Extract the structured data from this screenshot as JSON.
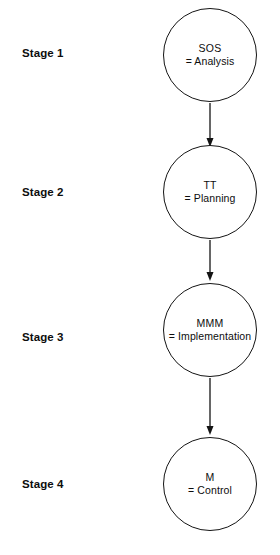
{
  "diagram": {
    "background_color": "#ffffff",
    "stroke_color": "#141414",
    "text_color": "#0d0d0d",
    "stages": [
      {
        "label": "Stage 1",
        "code": "SOS",
        "meaning": "= Analysis",
        "label_y": 54,
        "circle_cx": 210,
        "circle_cy": 55,
        "circle_r": 47
      },
      {
        "label": "Stage 2",
        "code": "TT",
        "meaning": "= Planning",
        "label_y": 193,
        "circle_cx": 210,
        "circle_cy": 192,
        "circle_r": 47
      },
      {
        "label": "Stage 3",
        "code": "MMM",
        "meaning": "= Implementation",
        "label_y": 338,
        "circle_cx": 210,
        "circle_cy": 330,
        "circle_r": 47
      },
      {
        "label": "Stage 4",
        "code": "M",
        "meaning": "= Control",
        "label_y": 485,
        "circle_cx": 210,
        "circle_cy": 484,
        "circle_r": 47
      }
    ],
    "connectors": [
      {
        "name": "arrow-stage1-to-stage2",
        "x": 210,
        "y_start": 103,
        "y_end": 147
      },
      {
        "name": "arrow-stage2-to-stage3",
        "x": 210,
        "y_start": 240,
        "y_end": 281
      },
      {
        "name": "arrow-stage3-to-stage4",
        "x": 210,
        "y_start": 378,
        "y_end": 435
      }
    ]
  }
}
